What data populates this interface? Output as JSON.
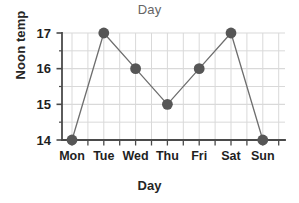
{
  "chart_data": {
    "type": "line",
    "title": "Day",
    "xlabel": "Day",
    "ylabel": "Noon temp",
    "categories": [
      "Mon",
      "Tue",
      "Wed",
      "Thu",
      "Fri",
      "Sat",
      "Sun"
    ],
    "values": [
      14,
      17,
      16,
      15,
      16,
      17,
      14
    ],
    "series": [
      {
        "name": "Noon temp",
        "values": [
          14,
          17,
          16,
          15,
          16,
          17,
          14
        ]
      }
    ],
    "points": [
      {
        "x": "Mon",
        "y": 14
      },
      {
        "x": "Tue",
        "y": 17
      },
      {
        "x": "Wed",
        "y": 16
      },
      {
        "x": "Thu",
        "y": 15
      },
      {
        "x": "Fri",
        "y": 16
      },
      {
        "x": "Sat",
        "y": 17
      },
      {
        "x": "Sun",
        "y": 14
      }
    ],
    "ylim": [
      14,
      17
    ],
    "yticks": [
      14,
      15,
      16,
      17
    ],
    "ytick_labels": [
      "14",
      "15",
      "16",
      "17"
    ],
    "y_minor_step": 0.5,
    "grid": true,
    "legend": false,
    "marker": "circle",
    "colors": {
      "marker": "#565656",
      "line": "#6e6e6e",
      "grid": "#d9d9d9",
      "axis": "#4a4a4a",
      "title_text": "#656565",
      "label_text": "#262626",
      "tick_text": "#1f1f1f",
      "background": "#ffffff"
    }
  },
  "axes": {
    "y": {
      "label": "Noon temp",
      "ticks": [
        {
          "value": 17,
          "label": "17"
        },
        {
          "value": 16,
          "label": "16"
        },
        {
          "value": 15,
          "label": "15"
        },
        {
          "value": 14,
          "label": "14"
        }
      ]
    },
    "x": {
      "label": "Day",
      "ticks": [
        {
          "value": "Mon",
          "label": "Mon"
        },
        {
          "value": "Tue",
          "label": "Tue"
        },
        {
          "value": "Wed",
          "label": "Wed"
        },
        {
          "value": "Thu",
          "label": "Thu"
        },
        {
          "value": "Fri",
          "label": "Fri"
        },
        {
          "value": "Sat",
          "label": "Sat"
        },
        {
          "value": "Sun",
          "label": "Sun"
        }
      ]
    }
  }
}
